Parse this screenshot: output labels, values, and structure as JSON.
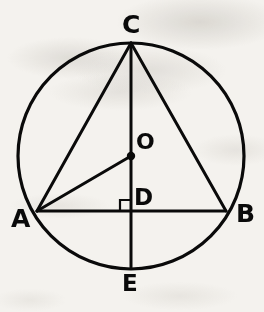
{
  "figure": {
    "kind": "circle-geometry-diagram",
    "background_color": "#f4f2ee",
    "stroke_color": "#0a0a0a",
    "width": 264,
    "height": 312,
    "circle": {
      "name": "main-circle",
      "center_x": 131,
      "center_y": 156,
      "radius": 113,
      "stroke_width": 3.2
    },
    "points": [
      {
        "id": "C",
        "label": "C",
        "x": 131,
        "y": 43,
        "marked": false,
        "description": "top of circle"
      },
      {
        "id": "O",
        "label": "O",
        "x": 131,
        "y": 156,
        "marked": true,
        "description": "center of circle"
      },
      {
        "id": "D",
        "label": "D",
        "x": 131,
        "y": 211,
        "marked": false,
        "description": "intersection of CE and AB"
      },
      {
        "id": "A",
        "label": "A",
        "x": 37,
        "y": 211,
        "marked": false,
        "description": "left end of chord AB"
      },
      {
        "id": "B",
        "label": "B",
        "x": 226,
        "y": 211,
        "marked": false,
        "description": "right end of chord AB"
      },
      {
        "id": "E",
        "label": "E",
        "x": 131,
        "y": 268,
        "marked": false,
        "description": "bottom of circle"
      }
    ],
    "segments": [
      {
        "id": "CE",
        "from": "C",
        "to": "E",
        "stroke_width": 3.0,
        "description": "vertical diameter through O and D"
      },
      {
        "id": "AB",
        "from": "A",
        "to": "B",
        "stroke_width": 3.0,
        "description": "horizontal chord"
      },
      {
        "id": "CA",
        "from": "C",
        "to": "A",
        "stroke_width": 3.0,
        "description": "chord from C to A"
      },
      {
        "id": "CB",
        "from": "C",
        "to": "B",
        "stroke_width": 3.0,
        "description": "chord from C to B"
      },
      {
        "id": "AO",
        "from": "A",
        "to": "O",
        "stroke_width": 3.0,
        "description": "radius from A to center O"
      }
    ],
    "right_angle_marker": {
      "id": "right-angle-at-D",
      "at_point": "D",
      "size": 11,
      "orientation": "upper-left",
      "stroke_width": 2.2
    },
    "center_dot": {
      "id": "center-dot-O",
      "x": 131,
      "y": 156,
      "radius": 4.2
    }
  }
}
